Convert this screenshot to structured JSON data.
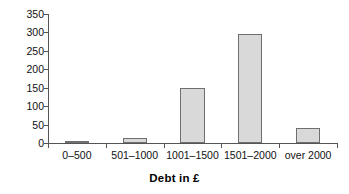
{
  "chart_data": {
    "type": "bar",
    "title": "",
    "xlabel": "Debt in £",
    "ylabel": "",
    "categories": [
      "0–500",
      "501–1000",
      "1001–1500",
      "1501–2000",
      "over 2000"
    ],
    "values": [
      3,
      13,
      148,
      295,
      40
    ],
    "ylim": [
      0,
      350
    ],
    "yticks": [
      0,
      50,
      100,
      150,
      200,
      250,
      300,
      350
    ],
    "ytick_labels": [
      "0",
      "50",
      "100",
      "150",
      "200",
      "250",
      "300",
      "350"
    ],
    "grid": false,
    "legend": false,
    "bar_fill_color": "#d9d9d9",
    "bar_border_color": "#6f6f6f",
    "axis_color": "#555555"
  }
}
